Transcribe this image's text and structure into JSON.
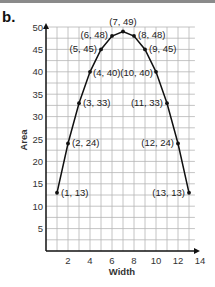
{
  "panel_label": "b.",
  "chart_data": {
    "type": "line",
    "title": "",
    "xlabel": "Width",
    "ylabel": "Area",
    "xlim": [
      0,
      14
    ],
    "ylim": [
      0,
      50
    ],
    "grid": true,
    "legend": null,
    "x_ticks": [
      2,
      4,
      6,
      8,
      10,
      12,
      14
    ],
    "y_ticks": [
      5,
      10,
      15,
      20,
      25,
      30,
      35,
      40,
      45,
      50
    ],
    "series": [
      {
        "name": "Area vs Width",
        "x": [
          1,
          2,
          3,
          4,
          5,
          6,
          7,
          8,
          9,
          10,
          11,
          12,
          13
        ],
        "values": [
          13,
          24,
          33,
          40,
          45,
          48,
          49,
          48,
          45,
          40,
          33,
          24,
          13
        ]
      }
    ],
    "point_labels": [
      "(1, 13)",
      "(2, 24)",
      "(3, 33)",
      "(4, 40)",
      "(5, 45)",
      "(6, 48)",
      "(7, 49)",
      "(8, 48)",
      "(9, 45)",
      "(10, 40)",
      "(11, 33)",
      "(12, 24)",
      "(13, 13)"
    ]
  }
}
